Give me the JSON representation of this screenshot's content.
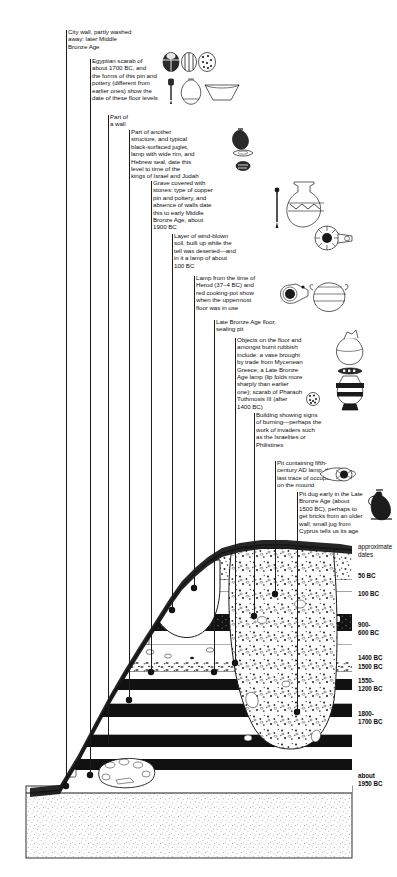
{
  "figure": {
    "type": "archaeological-section-diagram"
  },
  "annotations": [
    {
      "id": "city-wall",
      "name": "note-city-wall",
      "text": "City wall, partly washed\naway: later Middle\nBronze Age",
      "x": 68,
      "y": 28,
      "w": 95,
      "leader_x": 66,
      "leader_top": 28,
      "leader_bottom": 800
    },
    {
      "id": "egyptian-scarab",
      "name": "note-egyptian-scarab",
      "text": "Egyptian scarab of\nabout 1700 BC, and\nthe forms of this pin and\npottery (different from\nearlier ones) show the\ndate of these floor levels",
      "x": 92,
      "y": 57,
      "w": 100,
      "leader_x": 90,
      "leader_top": 57,
      "leader_bottom": 800
    },
    {
      "id": "part-of-a-wall",
      "name": "note-part-of-a-wall",
      "text": "Part of\na wall",
      "x": 110,
      "y": 113,
      "w": 40,
      "leader_x": 108,
      "leader_top": 113,
      "leader_bottom": 800
    },
    {
      "id": "black-surfaced-juglet",
      "name": "note-another-structure",
      "text": "Part of another\nstructure, and typical\nblack-surfaced juglet,\nlamp with wide rim, and\nHebrew seal, date this\nlevel to time of the\nkings of Israel and Judah",
      "x": 131,
      "y": 128,
      "w": 103,
      "leader_x": 129,
      "leader_top": 128,
      "leader_bottom": 800
    },
    {
      "id": "grave",
      "name": "note-grave",
      "text": "Grave covered with\nstones: type of copper\npin and pottery, and\nabsence of walls date\nthis to early Middle\nBronze Age, about\n1900 BC",
      "x": 153,
      "y": 179,
      "w": 100,
      "leader_x": 151,
      "leader_top": 179,
      "leader_bottom": 800
    },
    {
      "id": "wind-blown-soil",
      "name": "note-wind-blown-soil",
      "text": "Layer of wind-blown\nsoil, built up while the\ntell was deserted—and\nin it a lamp of about\n100 BC",
      "x": 174,
      "y": 232,
      "w": 100,
      "leader_x": 172,
      "leader_top": 232,
      "leader_bottom": 800
    },
    {
      "id": "herod-lamp",
      "name": "note-herod-lamp",
      "text": "Lamp from the time of\nHerod (37–4 BC) and\nred cooking-pot show\nwhen the uppermost\nfloor was in use",
      "x": 196,
      "y": 274,
      "w": 100,
      "leader_x": 194,
      "leader_top": 274,
      "leader_bottom": 800
    },
    {
      "id": "lba-floor",
      "name": "note-late-bronze-age-floor",
      "text": "Late Bronze Age floor,\nsealing pit",
      "x": 216,
      "y": 318,
      "w": 100,
      "leader_x": 214,
      "leader_top": 318,
      "leader_bottom": 800
    },
    {
      "id": "mycenaean",
      "name": "note-mycenaean-objects",
      "text": "Objects on the floor and\namongst burnt rubbish\ninclude: a vase brought\nby trade from Mycenean\nGreece; a Late Bronze\nAge lamp (lip folds more\nsharply than earlier\none); scarab of Pharaoh\nTuthmosis III (after\n1400 BC)",
      "x": 237,
      "y": 336,
      "w": 102,
      "leader_x": 235,
      "leader_top": 336,
      "leader_bottom": 800
    },
    {
      "id": "burning",
      "name": "note-burnt-building",
      "text": "Building showing signs\nof burning—perhaps the\nwork of invaders such\nas the Israelites or\nPhilistines",
      "x": 256,
      "y": 411,
      "w": 105,
      "leader_x": 254,
      "leader_top": 411,
      "leader_bottom": 800
    },
    {
      "id": "fifth-century-pit",
      "name": "note-fifth-century-pit",
      "text": "Pit containing fifth-\ncentury AD lamp, the\nlast trace of occupation\non the mound",
      "x": 277,
      "y": 459,
      "w": 105,
      "leader_x": 275,
      "leader_top": 459,
      "leader_bottom": 800
    },
    {
      "id": "brick-pit",
      "name": "note-brick-robbing-pit",
      "text": "Pit dug early in the Late\nBronze Age (about\n1500 BC), perhaps to\nget bricks from an older\nwall; small jug from\nCyprus tells us its age",
      "x": 299,
      "y": 490,
      "w": 100,
      "leader_x": 297,
      "leader_top": 490,
      "leader_bottom": 800
    }
  ],
  "date_scale": {
    "header": "approximate\ndates",
    "header_x": 358,
    "header_y": 543,
    "labels": [
      {
        "id": "d50bc",
        "name": "date-label-50-bc",
        "text": "50 BC",
        "x": 358,
        "y": 572
      },
      {
        "id": "d100bc",
        "name": "date-label-100-bc",
        "text": "100 BC",
        "x": 358,
        "y": 590
      },
      {
        "id": "d900",
        "name": "date-label-900-600-bc",
        "text": "900-\n600 BC",
        "x": 358,
        "y": 621
      },
      {
        "id": "d1400",
        "name": "date-label-1400-bc",
        "text": "1400 BC",
        "x": 358,
        "y": 654
      },
      {
        "id": "d1500",
        "name": "date-label-1500-bc",
        "text": "1500 BC",
        "x": 358,
        "y": 663
      },
      {
        "id": "d1550",
        "name": "date-label-1550-1200-bc",
        "text": "1550-\n1200 BC",
        "x": 358,
        "y": 677
      },
      {
        "id": "d1800",
        "name": "date-label-1800-1700-bc",
        "text": "1800-\n1700 BC",
        "x": 358,
        "y": 710
      },
      {
        "id": "d1950",
        "name": "date-label-about-1950-bc",
        "text": "about\n1950 BC",
        "x": 358,
        "y": 772
      }
    ]
  },
  "artifacts": [
    {
      "id": "scarab-a",
      "name": "scarab-icon",
      "label": "Egyptian scarab"
    },
    {
      "id": "scarab-b",
      "name": "scarab-icon",
      "label": "Egyptian scarab"
    },
    {
      "id": "scarab-c",
      "name": "scarab-icon",
      "label": "Egyptian scarab"
    },
    {
      "id": "pin-1",
      "name": "copper-pin-icon",
      "label": "Copper toggle pin"
    },
    {
      "id": "juglet-1",
      "name": "juglet-icon",
      "label": "Dipper juglet"
    },
    {
      "id": "bowl-1",
      "name": "bowl-icon",
      "label": "Carinated bowl"
    },
    {
      "id": "juglet-2",
      "name": "black-juglet-icon",
      "label": "Black-surfaced juglet"
    },
    {
      "id": "lamp-1",
      "name": "wide-rim-lamp-icon",
      "label": "Lamp with wide rim"
    },
    {
      "id": "seal-1",
      "name": "hebrew-seal-icon",
      "label": "Hebrew seal"
    },
    {
      "id": "pin-2",
      "name": "copper-pin-icon",
      "label": "Copper pin from grave"
    },
    {
      "id": "jar-1",
      "name": "mb-jar-icon",
      "label": "Middle Bronze Age jar"
    },
    {
      "id": "lamp-2",
      "name": "hellenistic-lamp-icon",
      "label": "Lamp of about 100 BC"
    },
    {
      "id": "lamp-3",
      "name": "herodian-lamp-icon",
      "label": "Herodian lamp"
    },
    {
      "id": "pot-1",
      "name": "cooking-pot-icon",
      "label": "Red cooking-pot"
    },
    {
      "id": "vase-1",
      "name": "mycenaean-vase-icon",
      "label": "Mycenaean stirrup vase"
    },
    {
      "id": "lamp-4",
      "name": "lb-lamp-icon",
      "label": "Late Bronze Age lamp"
    },
    {
      "id": "vase-2",
      "name": "lb-vase-icon",
      "label": "Late Bronze Age vase"
    },
    {
      "id": "scarab-d",
      "name": "tuthmosis-scarab-icon",
      "label": "Scarab of Tuthmosis III"
    },
    {
      "id": "lamp-5",
      "name": "byzantine-lamp-icon",
      "label": "Fifth-century AD lamp"
    },
    {
      "id": "jug-1",
      "name": "cypriot-jug-icon",
      "label": "Small jug from Cyprus"
    }
  ],
  "colors": {
    "ink": "#1a1a1a",
    "paper": "#ffffff",
    "dark_layer": "#141414",
    "stipple": "#5a5a5a"
  }
}
